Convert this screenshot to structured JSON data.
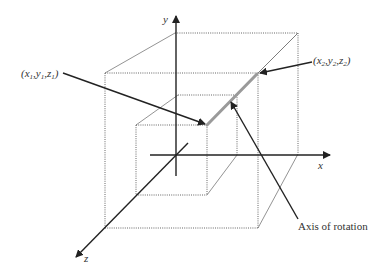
{
  "diagram": {
    "axes": {
      "x_label": "x",
      "y_label": "y",
      "z_label": "z"
    },
    "points": {
      "p1": {
        "var_x": "x",
        "var_y": "y",
        "var_z": "z",
        "index": "1"
      },
      "p2": {
        "var_x": "x",
        "var_y": "y",
        "var_z": "z",
        "index": "2"
      }
    },
    "annotation": {
      "axis_of_rotation": "Axis of rotation"
    },
    "colors": {
      "axis": "#222222",
      "rotation_axis": "#9a9a9a",
      "cube_edges": "#555555"
    }
  }
}
